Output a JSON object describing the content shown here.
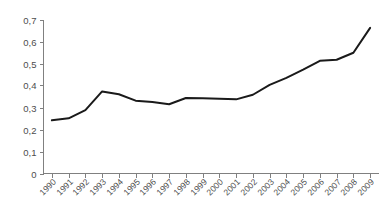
{
  "chart_data": {
    "type": "line",
    "title": "",
    "subtitle": "",
    "xlabel": "",
    "ylabel": "",
    "grid": false,
    "legend": false,
    "legend_position": "none",
    "decimal_separator": ",",
    "line_color": "#1a1a1a",
    "axis_color": "#808080",
    "tick_label_color": "#4d4d4d",
    "background_color": "#ffffff",
    "ylim": [
      0,
      0.7
    ],
    "ytick_labels": [
      "0,7",
      "0,6",
      "0,5",
      "0,4",
      "0,3",
      "0,2",
      "0,1",
      "0"
    ],
    "ytick_values": [
      0.7,
      0.6,
      0.5,
      0.4,
      0.3,
      0.2,
      0.1,
      0
    ],
    "categories": [
      "1990",
      "1991",
      "1992",
      "1993",
      "1994",
      "1995",
      "1996",
      "1997",
      "1998",
      "1999",
      "2000",
      "2001",
      "2002",
      "2003",
      "2004",
      "2005",
      "2006",
      "2007",
      "2008",
      "2009"
    ],
    "values": [
      0.242,
      0.251,
      0.288,
      0.373,
      0.36,
      0.331,
      0.325,
      0.315,
      0.343,
      0.342,
      0.34,
      0.337,
      0.358,
      0.403,
      0.435,
      0.472,
      0.512,
      0.517,
      0.549,
      0.662
    ],
    "annotations": []
  }
}
